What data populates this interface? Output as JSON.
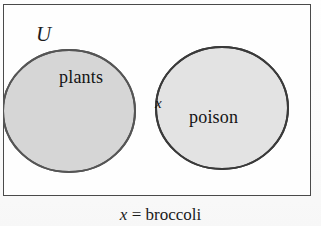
{
  "figure": {
    "type": "venn-diagram",
    "universe": {
      "label": "U",
      "name": "universal-set"
    },
    "sets": [
      {
        "id": "left",
        "label": "plants",
        "fill": "#d6d6d6",
        "stroke": "#555555"
      },
      {
        "id": "right",
        "label": "poison",
        "fill": "#e2e2e2",
        "stroke": "#3c3c3c"
      }
    ],
    "intersection": {
      "label": "x",
      "fill": "#bfbfbf"
    },
    "caption": {
      "variable": "x",
      "relation": "=",
      "value": "broccoli",
      "full": "x = broccoli"
    },
    "colors": {
      "border": "#4a4a4a",
      "background": "#fefefe",
      "text": "#141414"
    }
  }
}
